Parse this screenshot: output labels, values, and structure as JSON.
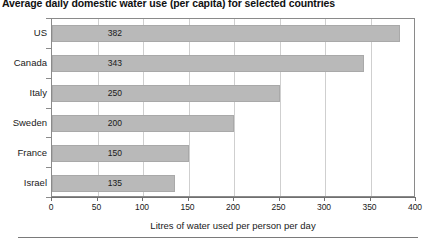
{
  "chart_data": {
    "type": "bar",
    "orientation": "horizontal",
    "title": "Average daily domestic water use (per capita) for selected countries",
    "categories": [
      "US",
      "Canada",
      "Italy",
      "Sweden",
      "France",
      "Israel"
    ],
    "values": [
      382,
      343,
      250,
      200,
      150,
      135
    ],
    "value_labels": [
      "382",
      "343",
      "250",
      "200",
      "150",
      "135"
    ],
    "xlabel": "Litres of water used per person per day",
    "ylabel": "",
    "xlim": [
      0,
      400
    ],
    "xticks": [
      0,
      50,
      100,
      150,
      200,
      250,
      300,
      350,
      400
    ],
    "xtick_labels": [
      "0",
      "50",
      "100",
      "150",
      "200",
      "250",
      "300",
      "350",
      "400"
    ],
    "grid": "vertical",
    "legend": "none",
    "bar_color": "#b9b9b9",
    "bar_edge_color": "#a9a9a9",
    "frame_color": "#8a8a8a",
    "gridline_color": "#cfcfcf",
    "text_color": "#1a1a1a"
  }
}
